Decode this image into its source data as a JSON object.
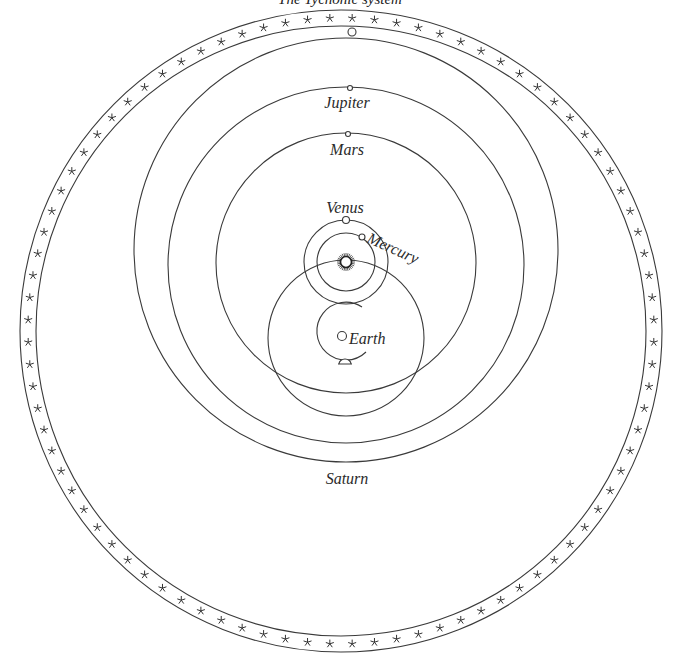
{
  "caption": "The Tychonic system",
  "labels": {
    "jupiter": "Jupiter",
    "mars": "Mars",
    "venus": "Venus",
    "mercury": "Mercury",
    "earth": "Earth",
    "saturn": "Saturn"
  },
  "geometry": {
    "star_band": {
      "cx": 341,
      "cy": 331,
      "r_outer": 321,
      "r_inner": 305,
      "star_count": 88
    },
    "sun": {
      "x": 346,
      "y": 262,
      "r": 6
    },
    "orbits": [
      {
        "name": "saturn",
        "cx": 346,
        "cy": 250,
        "r": 212
      },
      {
        "name": "jupiter",
        "cx": 346,
        "cy": 265,
        "r": 178
      },
      {
        "name": "mars",
        "cx": 346,
        "cy": 263,
        "r": 130
      },
      {
        "name": "venus",
        "cx": 346,
        "cy": 262,
        "r": 42
      },
      {
        "name": "mercury",
        "cx": 346,
        "cy": 262,
        "r": 29
      },
      {
        "name": "sun-path",
        "cx": 346,
        "cy": 338,
        "r": 78
      }
    ],
    "earth": {
      "x": 345,
      "y": 336
    },
    "moon_orbit": {
      "cx": 346,
      "cy": 331,
      "r": 29
    }
  }
}
